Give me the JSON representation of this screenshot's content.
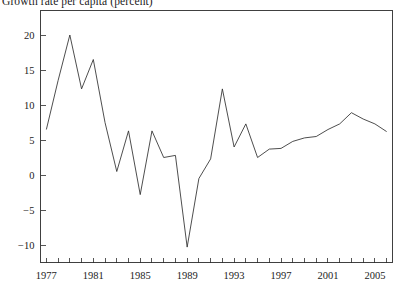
{
  "chart_data": {
    "type": "line",
    "title": "Growth rate per capita (percent)",
    "xlabel": "",
    "ylabel": "",
    "grid": false,
    "legend": false,
    "legend_position": "none",
    "xlim": [
      1976.5,
      2006.5
    ],
    "ylim": [
      -12.5,
      23.5
    ],
    "yticks": [
      -10,
      -5,
      0,
      5,
      10,
      15,
      20
    ],
    "ytick_labels": [
      "−10",
      "−5",
      "0",
      "5",
      "10",
      "15",
      "20"
    ],
    "xticks": [
      1977,
      1978,
      1979,
      1980,
      1981,
      1982,
      1983,
      1984,
      1985,
      1986,
      1987,
      1988,
      1989,
      1990,
      1991,
      1992,
      1993,
      1994,
      1995,
      1996,
      1997,
      1998,
      1999,
      2000,
      2001,
      2002,
      2003,
      2004,
      2005,
      2006
    ],
    "xtick_labels_shown": [
      "1977",
      "1981",
      "1985",
      "1989",
      "1993",
      "1997",
      "2001",
      "2005"
    ],
    "xtick_labels_shown_values": [
      1977,
      1981,
      1985,
      1989,
      1993,
      1997,
      2001,
      2005
    ],
    "line_color": "#2e2e2e",
    "x": [
      1977,
      1978,
      1979,
      1980,
      1981,
      1982,
      1983,
      1984,
      1985,
      1986,
      1987,
      1988,
      1989,
      1990,
      1991,
      1992,
      1993,
      1994,
      1995,
      1996,
      1997,
      1998,
      1999,
      2000,
      2001,
      2002,
      2003,
      2004,
      2005,
      2006
    ],
    "values": [
      6.5,
      13.5,
      20.0,
      12.3,
      16.5,
      7.5,
      0.5,
      6.3,
      -2.8,
      6.3,
      2.5,
      2.8,
      -10.3,
      -0.5,
      2.3,
      12.3,
      4.0,
      7.3,
      2.5,
      3.7,
      3.8,
      4.8,
      5.3,
      5.5,
      6.5,
      7.3,
      8.9,
      8.0,
      7.3,
      6.2
    ]
  }
}
